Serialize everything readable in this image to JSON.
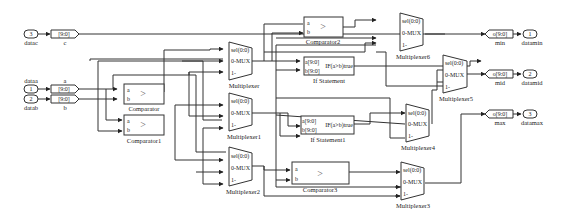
{
  "diagram": {
    "inports": [
      {
        "number": "3",
        "name": "datac",
        "goto": "[9:0]",
        "signal": "c"
      },
      {
        "number": "1",
        "name": "dataa",
        "goto": "[9:0]",
        "signal": "a"
      },
      {
        "number": "2",
        "name": "datab",
        "goto": "[9:0]",
        "signal": "b"
      }
    ],
    "comparators": [
      {
        "name": "Comparator",
        "in_a": "a",
        "in_b": "b",
        "symbol": ">"
      },
      {
        "name": "Comparator1",
        "in_a": "a",
        "in_b": "b",
        "symbol": ">"
      },
      {
        "name": "Comparator2",
        "in_a": "a",
        "in_b": "b",
        "symbol": ">"
      },
      {
        "name": "Comparator3",
        "in_a": "a",
        "in_b": "b",
        "symbol": ">"
      }
    ],
    "if_blocks": [
      {
        "name": "If Statement",
        "in_a": "a[9:0]",
        "in_b": "b[9:0]",
        "out": "IF(a>b)true"
      },
      {
        "name": "If Statement1",
        "in_a": "a[9:0]",
        "in_b": "b[9:0]",
        "out": "IF(a>b)true"
      }
    ],
    "muxes": [
      {
        "name": "Multiplexer",
        "sel": "sel(0:0)",
        "in0": "0-MUX",
        "in1": "1-"
      },
      {
        "name": "Multiplexer1",
        "sel": "sel(0:0)",
        "in0": "0-MUX",
        "in1": "1-"
      },
      {
        "name": "Multiplexer2",
        "sel": "sel(0:0)",
        "in0": "0-MUX",
        "in1": "1-"
      },
      {
        "name": "Multiplexer3",
        "sel": "sel(0:0)",
        "in0": "0-MUX",
        "in1": "1-"
      },
      {
        "name": "Multiplexer4",
        "sel": "sel(0:0)",
        "in0": "0-MUX",
        "in1": "1-"
      },
      {
        "name": "Multiplexer5",
        "sel": "sel(0:0)",
        "in0": "0-MUX",
        "in1": "1-"
      },
      {
        "name": "Multiplexer6",
        "sel": "sel(0:0)",
        "in0": "0-MUX",
        "in1": "1-"
      }
    ],
    "outports": [
      {
        "number": "1",
        "name": "datamin",
        "from": "o[9:0]",
        "signal": "min"
      },
      {
        "number": "2",
        "name": "datamid",
        "from": "o[9:0]",
        "signal": "mid"
      },
      {
        "number": "3",
        "name": "datamax",
        "from": "o[9:0]",
        "signal": "max"
      }
    ]
  }
}
